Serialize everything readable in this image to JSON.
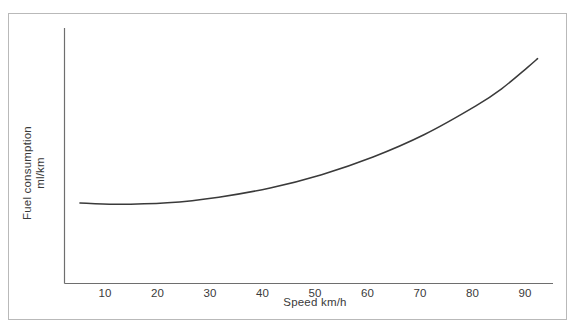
{
  "chart_data": {
    "type": "line",
    "title": "",
    "xlabel": "Speed km/h",
    "ylabel_line1": "Fuel consumption",
    "ylabel_line2": "ml/km",
    "xticks": [
      10,
      20,
      30,
      40,
      50,
      60,
      70,
      80,
      90
    ],
    "xtick_labels": [
      "10",
      "20",
      "30",
      "40",
      "50",
      "60",
      "70",
      "80",
      "90"
    ],
    "yticks": [],
    "ytick_labels": [],
    "xlim": [
      0,
      95
    ],
    "ylim": [
      0,
      100
    ],
    "grid": false,
    "legend": null,
    "series": [
      {
        "name": "Fuel consumption vs speed",
        "color": "#3a3a3a",
        "x": [
          3,
          10,
          20,
          30,
          40,
          50,
          60,
          70,
          80,
          85,
          90,
          92
        ],
        "y": [
          31.5,
          31.0,
          31.6,
          33.8,
          37.4,
          42.6,
          49.5,
          58.3,
          69.5,
          76.2,
          84.5,
          88.0
        ],
        "description": "U-shaped fuel consumption curve, shallow minimum near 10-20 km/h rising steeply above 60 km/h"
      }
    ],
    "annotations": []
  },
  "axes": {
    "x_axis_name": "speed-axis",
    "y_axis_name": "fuel-consumption-axis"
  }
}
